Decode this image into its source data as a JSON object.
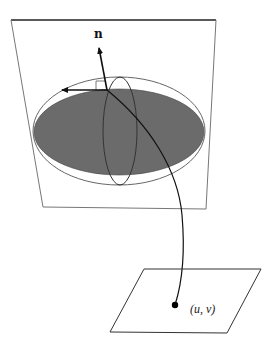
{
  "diagram": {
    "labels": {
      "normal": "n",
      "param_point": "(u, v)"
    },
    "colors": {
      "line": "#333333",
      "plane_edge": "#777777",
      "plane_top_edge": "#222222",
      "disk_fill": "#6b6b6b",
      "ellipse_outline": "#666666",
      "arrow": "#111111",
      "dot": "#000000"
    },
    "elements": {
      "upper_plane": {
        "corners": [
          [
            11,
            20
          ],
          [
            216,
            20
          ],
          [
            206,
            209
          ],
          [
            43,
            207
          ]
        ]
      },
      "outer_ellipse": {
        "cx": 119,
        "cy": 131,
        "rx": 86,
        "ry": 54
      },
      "shaded_disk": {
        "cx": 119,
        "cy": 132,
        "rx": 85,
        "ry": 43
      },
      "vertical_ellipse": {
        "cx": 120,
        "cy": 131,
        "rx": 17,
        "ry": 54
      },
      "origin": [
        107,
        90
      ],
      "normal_arrow_tip": [
        99,
        46
      ],
      "tangent_arrow_tip": [
        60,
        90
      ],
      "lower_plane": {
        "corners": [
          [
            144,
            269
          ],
          [
            261,
            269
          ],
          [
            227,
            333
          ],
          [
            110,
            332
          ]
        ]
      },
      "dot": [
        175,
        305
      ]
    }
  }
}
